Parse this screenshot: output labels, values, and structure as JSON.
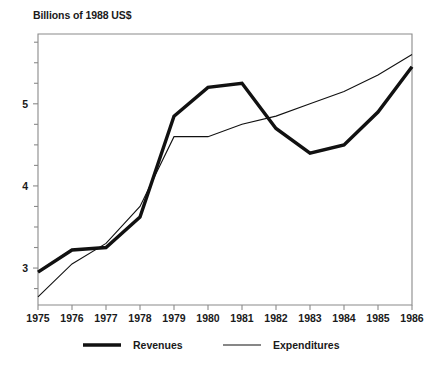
{
  "chart_data": {
    "type": "line",
    "title": "Billions of 1988 US$",
    "xlabel": "",
    "ylabel": "",
    "x": [
      1975,
      1976,
      1977,
      1978,
      1979,
      1980,
      1981,
      1982,
      1983,
      1984,
      1985,
      1986
    ],
    "xticklabels": [
      "1975",
      "1976",
      "1977",
      "1978",
      "1979",
      "1980",
      "1981",
      "1982",
      "1983",
      "1984",
      "1985",
      "1986"
    ],
    "yticklabels": [
      "3",
      "4",
      "5"
    ],
    "ytickvalues": [
      3,
      4,
      5
    ],
    "yminorticks": [
      2.75,
      3.25,
      3.5,
      3.75,
      4.25,
      4.5,
      4.75,
      5.25,
      5.5,
      5.75
    ],
    "xlim": [
      1975,
      1986
    ],
    "ylim": [
      2.55,
      5.85
    ],
    "grid": false,
    "legend_position": "bottom",
    "series": [
      {
        "name": "Revenues",
        "style": "thick-solid",
        "color": "#111111",
        "linewidth": 3.4,
        "values": [
          2.95,
          3.22,
          3.25,
          3.62,
          4.85,
          5.2,
          5.25,
          4.7,
          4.4,
          4.5,
          4.9,
          5.45
        ]
      },
      {
        "name": "Expenditures",
        "style": "thin-solid",
        "color": "#111111",
        "linewidth": 1.1,
        "values": [
          2.65,
          3.05,
          3.3,
          3.75,
          4.6,
          4.6,
          4.75,
          4.85,
          5.0,
          5.15,
          5.35,
          5.6
        ]
      }
    ]
  },
  "legend": {
    "items": [
      {
        "label": "Revenues"
      },
      {
        "label": "Expenditures"
      }
    ]
  },
  "colors": {
    "axis": "#8a8a8a",
    "ink": "#111111",
    "background": "#ffffff"
  }
}
